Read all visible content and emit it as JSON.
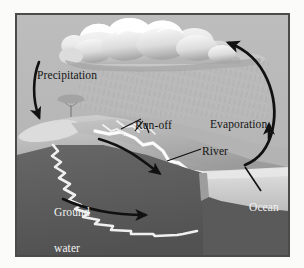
{
  "figure": {
    "frame": {
      "border_color": "#4b4b4b",
      "outer_background": "#fbfbfa"
    }
  },
  "palette": {
    "sky": "#b9b9b9",
    "rain_haze": "#c6c6c6",
    "cloud_light": "#fdfdfd",
    "cloud_mid": "#e2e2e2",
    "cloud_shadow": "#a9a9a9",
    "hill_light": "#c9c9c9",
    "hill_mid": "#a2a2a2",
    "ground_dark": "#5f5f5f",
    "ground_darker": "#565656",
    "ocean_light": "#d6d6d6",
    "ocean_mid": "#c0c0c0",
    "water_white": "#f4f4f4",
    "arrow": "#111111",
    "label_dark": "#141414",
    "label_light": "#f2f2f2"
  },
  "labels": {
    "precipitation": "Precipitation",
    "evaporation": "Evaporation",
    "runoff": "Run-off",
    "river": "River",
    "ground_water_line1": "Ground",
    "ground_water_line2": "water",
    "ocean": "Ocean"
  },
  "elements": {
    "cloud": "cloud-shape",
    "rain": "rain-hatching",
    "tree": "tree-silhouette",
    "precipitation_arrow": "downward-curved-arrow",
    "evaporation_arrow": "large-curved-arrow-right",
    "river_arrow": "river-flow-arrow",
    "groundwater_arrow": "groundwater-flow-arrow",
    "runoff_leaders": "runoff-leader-lines",
    "river_leader": "river-leader-line",
    "ocean_leader": "ocean-leader-line",
    "groundwater_channel": "zigzag-groundwater-channel",
    "river_channel": "zigzag-river-channel"
  }
}
